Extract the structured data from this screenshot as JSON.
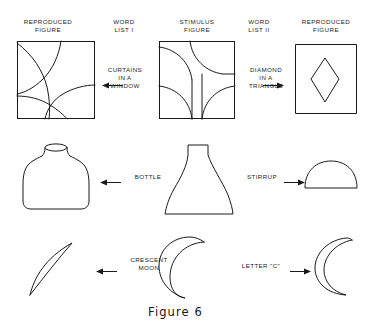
{
  "figure": {
    "caption": "Figure 6"
  },
  "columns": [
    {
      "id": "reproduced-left",
      "label": "REPRODUCED\nFIGURE"
    },
    {
      "id": "word-list-1",
      "label": "WORD\nLIST I"
    },
    {
      "id": "stimulus",
      "label": "STIMULUS\nFIGURE"
    },
    {
      "id": "word-list-2",
      "label": "WORD\nLIST II"
    },
    {
      "id": "reproduced-right",
      "label": "REPRODUCED\nFIGURE"
    }
  ],
  "rows": [
    {
      "id": "row-curtains-diamond",
      "left_figure": "rectangle-with-four-arcs",
      "left_label": "CURTAINS\nIN A\nWINDOW",
      "left_arrow": "arrow-left",
      "stimulus_figure": "rectangle-with-symmetric-corner-arcs",
      "right_label": "DIAMOND\nIN A\nTRIANGLE",
      "right_arrow": "arrow-right",
      "right_figure": "rectangle-with-diamond"
    },
    {
      "id": "row-bottle-stirrup",
      "left_figure": "bottle-shape",
      "left_label": "BOTTLE",
      "left_arrow": "arrow-left",
      "stimulus_figure": "flask-vase-shape",
      "right_label": "STIRRUP",
      "right_arrow": "arrow-right",
      "right_figure": "semicircle-dome-shape"
    },
    {
      "id": "row-crescent-letter-c",
      "left_figure": "thin-sliver-crescent",
      "left_label": "CRESCENT\nMOON",
      "left_arrow": "arrow-left",
      "stimulus_figure": "thick-crescent-moon",
      "right_label": "LETTER \"C\"",
      "right_arrow": "arrow-right",
      "right_figure": "narrow-crescent-c-shape"
    }
  ],
  "style": {
    "ink": "#1a1a1a",
    "paper": "#ffffff"
  }
}
